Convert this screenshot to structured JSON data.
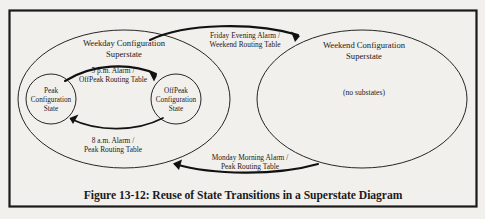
{
  "figure": {
    "caption": "Figure 13-12: Reuse of State Transitions in a Superstate Diagram"
  },
  "superstates": {
    "weekday": {
      "title_line1": "Weekday Configuration",
      "title_line2": "Superstate"
    },
    "weekend": {
      "title_line1": "Weekend Configuration",
      "title_line2": "Superstate",
      "note": "(no substates)"
    }
  },
  "states": {
    "peak": {
      "line1": "Peak",
      "line2": "Configuration",
      "line3": "State"
    },
    "offpeak": {
      "line1": "OffPeak",
      "line2": "Configuration",
      "line3": "State"
    }
  },
  "transitions": {
    "friday_evening": {
      "line1": "Friday Evening Alarm /",
      "line2": "Weekend Routing Table"
    },
    "five_pm": {
      "line1": "5 p.m. Alarm /",
      "line2": "OffPeak Routing Table"
    },
    "eight_am": {
      "line1": "8 a.m. Alarm /",
      "line2": "Peak Routing Table"
    },
    "monday_morning": {
      "line1": "Monday Morning Alarm /",
      "line2": "Peak Routing Table"
    }
  },
  "colors": {
    "ink": "#1b1b1b",
    "page": "#f2f0ec",
    "stroke": "#262626"
  }
}
